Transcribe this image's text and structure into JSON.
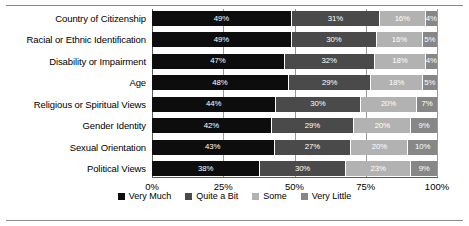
{
  "chart_data": {
    "type": "bar",
    "orientation": "horizontal",
    "stacked": true,
    "normalized": true,
    "title": "",
    "xlabel": "",
    "ylabel": "",
    "xlim": [
      0,
      100
    ],
    "grid": true,
    "legend_position": "bottom",
    "xticks": [
      "0%",
      "25%",
      "50%",
      "75%",
      "100%"
    ],
    "xtick_values": [
      0,
      25,
      50,
      75,
      100
    ],
    "categories": [
      "Country of Citizenship",
      "Racial or Ethnic Identification",
      "Disability or Impairment",
      "Age",
      "Religious or Spiritual Views",
      "Gender Identity",
      "Sexual Orientation",
      "Political Views"
    ],
    "series": [
      {
        "name": "Very Much",
        "color": "#0d0d0d",
        "values": [
          49,
          49,
          47,
          48,
          44,
          42,
          43,
          38
        ],
        "labels": [
          "49%",
          "49%",
          "47%",
          "48%",
          "44%",
          "42%",
          "43%",
          "38%"
        ]
      },
      {
        "name": "Quite a Bit",
        "color": "#4a4a4a",
        "values": [
          31,
          30,
          32,
          29,
          30,
          29,
          27,
          30
        ],
        "labels": [
          "31%",
          "30%",
          "32%",
          "29%",
          "30%",
          "29%",
          "27%",
          "30%"
        ]
      },
      {
        "name": "Some",
        "color": "#b2b2b2",
        "values": [
          16,
          16,
          18,
          18,
          20,
          20,
          20,
          23
        ],
        "labels": [
          "16%",
          "16%",
          "18%",
          "18%",
          "20%",
          "20%",
          "20%",
          "23%"
        ]
      },
      {
        "name": "Very Little",
        "color": "#878787",
        "values": [
          4,
          5,
          4,
          5,
          7,
          9,
          10,
          9
        ],
        "labels": [
          "4%",
          "5%",
          "4%",
          "5%",
          "7%",
          "9%",
          "10%",
          "9%"
        ]
      }
    ]
  }
}
